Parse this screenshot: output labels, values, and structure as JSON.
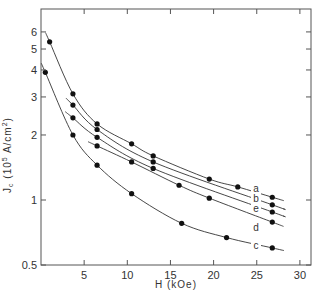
{
  "chart_data": {
    "type": "line",
    "title": "",
    "xlabel": "H (kOe)",
    "ylabel": "J_c (10^5 A/cm^2)",
    "xlim": [
      0,
      31
    ],
    "ylim": [
      0.5,
      7
    ],
    "yscale": "log",
    "x_ticks": [
      5,
      10,
      15,
      20,
      25,
      30
    ],
    "x_tick_labels": [
      "5",
      "10",
      "15",
      "20",
      "25",
      "30"
    ],
    "y_ticks": [
      0.5,
      1,
      2,
      3,
      4,
      5,
      6
    ],
    "y_tick_labels": [
      "0.5",
      "1",
      "2",
      "3",
      "4",
      "5",
      "6"
    ],
    "grid": false,
    "legend": "curve labels inline at right",
    "series": [
      {
        "name": "a",
        "points": [
          [
            1.0,
            5.4
          ],
          [
            3.7,
            3.1
          ],
          [
            6.5,
            2.25
          ],
          [
            10.5,
            1.82
          ],
          [
            13.0,
            1.6
          ],
          [
            19.5,
            1.25
          ],
          [
            22.8,
            1.15
          ],
          [
            26.8,
            1.03
          ]
        ]
      },
      {
        "name": "b",
        "points": [
          [
            3.7,
            2.75
          ],
          [
            6.5,
            2.12
          ],
          [
            13.0,
            1.5
          ],
          [
            26.8,
            0.95
          ]
        ]
      },
      {
        "name": "e",
        "points": [
          [
            3.7,
            2.4
          ],
          [
            6.5,
            1.95
          ],
          [
            13.0,
            1.4
          ],
          [
            26.8,
            0.88
          ]
        ]
      },
      {
        "name": "d",
        "points": [
          [
            6.5,
            1.78
          ],
          [
            10.5,
            1.5
          ],
          [
            16.0,
            1.17
          ],
          [
            19.5,
            1.02
          ],
          [
            26.8,
            0.79
          ]
        ]
      },
      {
        "name": "c",
        "points": [
          [
            0.5,
            3.9
          ],
          [
            3.7,
            2.0
          ],
          [
            6.5,
            1.45
          ],
          [
            10.5,
            1.07
          ],
          [
            16.3,
            0.78
          ],
          [
            21.5,
            0.67
          ],
          [
            26.8,
            0.6
          ]
        ]
      }
    ]
  }
}
